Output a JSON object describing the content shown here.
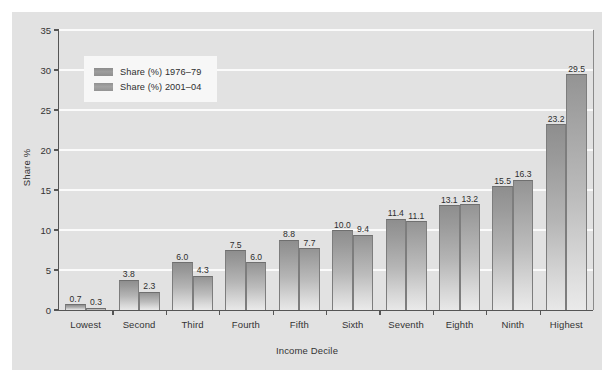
{
  "chart_data": {
    "type": "bar",
    "title": "",
    "xlabel": "Income Decile",
    "ylabel": "Share %",
    "ylim": [
      0,
      35
    ],
    "yticks": [
      0,
      5,
      10,
      15,
      20,
      25,
      30,
      35
    ],
    "ytick_labels": [
      "0",
      "5",
      "10",
      "15",
      "20",
      "25",
      "30",
      "35"
    ],
    "grid": true,
    "legend_position": "upper-left",
    "categories": [
      "Lowest",
      "Second",
      "Third",
      "Fourth",
      "Fifth",
      "Sixth",
      "Seventh",
      "Eighth",
      "Ninth",
      "Highest"
    ],
    "series": [
      {
        "name": "Share (%) 1976–79",
        "color": "#9a9a9a",
        "values": [
          0.7,
          3.8,
          6.0,
          7.5,
          8.8,
          10.0,
          11.4,
          13.1,
          15.5,
          23.2
        ],
        "labels": [
          "0.7",
          "3.8",
          "6.0",
          "7.5",
          "8.8",
          "10.0",
          "11.4",
          "13.1",
          "15.5",
          "23.2"
        ]
      },
      {
        "name": "Share (%) 2001–04",
        "color": "#a2a2a2",
        "values": [
          0.3,
          2.3,
          4.3,
          6.0,
          7.7,
          9.4,
          11.1,
          13.2,
          16.3,
          29.5
        ],
        "labels": [
          "0.3",
          "2.3",
          "4.3",
          "6.0",
          "7.7",
          "9.4",
          "11.1",
          "13.2",
          "16.3",
          "29.5"
        ]
      }
    ]
  },
  "figure": {
    "background": "#e2e2e2",
    "plot_background": "#e2e2e2",
    "gridline_color": "#fbfbfb",
    "axis_color": "#555555",
    "legend_background": "#f7f7f7"
  }
}
